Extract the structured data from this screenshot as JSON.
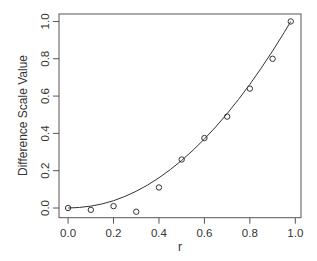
{
  "chart_data": {
    "type": "scatter",
    "title": "",
    "xlabel": "r",
    "ylabel": "Difference Scale Value",
    "xlim": [
      -0.04,
      1.025
    ],
    "ylim": [
      -0.052,
      1.04
    ],
    "grid": false,
    "legend": null,
    "xticks": [
      0.0,
      0.2,
      0.4,
      0.6,
      0.8,
      1.0
    ],
    "xtick_labels": [
      "0.0",
      "0.2",
      "0.4",
      "0.6",
      "0.8",
      "1.0"
    ],
    "yticks": [
      0.0,
      0.2,
      0.4,
      0.6,
      0.8,
      1.0
    ],
    "ytick_labels": [
      "0.0",
      "0.2",
      "0.4",
      "0.6",
      "0.8",
      "1.0"
    ],
    "series": [
      {
        "name": "observed",
        "kind": "points",
        "marker": "open-circle",
        "x": [
          0.0,
          0.1,
          0.2,
          0.3,
          0.4,
          0.5,
          0.6,
          0.7,
          0.8,
          0.9,
          0.98
        ],
        "y": [
          0.0,
          -0.01,
          0.01,
          -0.02,
          0.11,
          0.26,
          0.375,
          0.49,
          0.64,
          0.8,
          1.0
        ]
      },
      {
        "name": "fitted curve",
        "kind": "line",
        "x": [
          0.0,
          0.05,
          0.1,
          0.15,
          0.2,
          0.25,
          0.3,
          0.35,
          0.4,
          0.45,
          0.5,
          0.55,
          0.6,
          0.65,
          0.7,
          0.75,
          0.8,
          0.85,
          0.9,
          0.95,
          0.98
        ],
        "y": [
          0.0,
          0.003,
          0.01,
          0.022,
          0.039,
          0.062,
          0.09,
          0.123,
          0.162,
          0.206,
          0.255,
          0.31,
          0.37,
          0.435,
          0.506,
          0.582,
          0.663,
          0.75,
          0.842,
          0.939,
          1.0
        ]
      }
    ],
    "colors": {
      "line": "#333333",
      "points": "#333333",
      "box": "#555555",
      "background": "#ffffff"
    }
  }
}
